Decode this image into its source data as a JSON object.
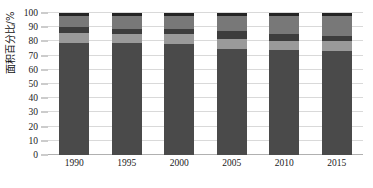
{
  "chart_data": {
    "type": "bar",
    "stacked": true,
    "title": "",
    "xlabel": "",
    "ylabel": "面积百分比/%",
    "categories": [
      "1990",
      "1995",
      "2000",
      "2005",
      "2010",
      "2015"
    ],
    "ylim": [
      0,
      100
    ],
    "yticks": [
      0,
      10,
      20,
      30,
      40,
      50,
      60,
      70,
      80,
      90,
      100
    ],
    "grid": true,
    "legend": "none",
    "series": [
      {
        "name": "series-1",
        "color": "#4a4a4a",
        "values": [
          79,
          79,
          78,
          75,
          74,
          73
        ]
      },
      {
        "name": "series-2",
        "color": "#9a9a9a",
        "values": [
          7,
          6,
          7,
          7,
          6,
          7
        ]
      },
      {
        "name": "series-3",
        "color": "#3d3d3d",
        "values": [
          4,
          4,
          4,
          5,
          5,
          4
        ]
      },
      {
        "name": "series-4",
        "color": "#787878",
        "values": [
          8,
          9,
          9,
          11,
          13,
          14
        ]
      },
      {
        "name": "series-5",
        "color": "#242424",
        "values": [
          2,
          2,
          2,
          2,
          2,
          2
        ]
      }
    ]
  },
  "colors": {
    "gridline": "#d9d9d9",
    "baseline": "#b0b0b0",
    "tickmark": "#9a9a9a",
    "text": "#1a1a1a",
    "background": "#ffffff"
  }
}
